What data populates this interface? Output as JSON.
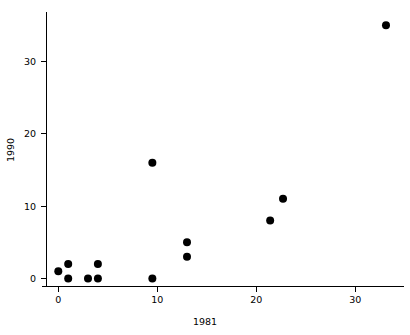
{
  "chart_data": {
    "type": "scatter",
    "title": "",
    "xlabel": "1981",
    "ylabel": "1990",
    "xlim": [
      -1.5,
      35.5
    ],
    "ylim": [
      -1.5,
      36.5
    ],
    "xticks": [
      0,
      10,
      20,
      30
    ],
    "xticklabels": [
      "0",
      "10",
      "20",
      "30"
    ],
    "yticks": [
      0,
      10,
      20,
      30
    ],
    "yticklabels": [
      "0",
      "10",
      "20",
      "30"
    ],
    "grid": false,
    "legend": null,
    "marker": {
      "shape": "circle",
      "color": "#000000",
      "size": 4.0
    },
    "series": [
      {
        "name": "points",
        "points": [
          {
            "x": 0,
            "y": 1
          },
          {
            "x": 1,
            "y": 2
          },
          {
            "x": 1,
            "y": 0
          },
          {
            "x": 3,
            "y": 0
          },
          {
            "x": 4,
            "y": 2
          },
          {
            "x": 4,
            "y": 0
          },
          {
            "x": 9.5,
            "y": 16
          },
          {
            "x": 9.5,
            "y": 0
          },
          {
            "x": 13,
            "y": 5
          },
          {
            "x": 13,
            "y": 3
          },
          {
            "x": 21.4,
            "y": 8
          },
          {
            "x": 22.7,
            "y": 11
          },
          {
            "x": 33.1,
            "y": 35
          }
        ]
      }
    ]
  },
  "axes": {
    "x_axis_label": "1981",
    "y_axis_label": "1990",
    "x_tick_labels": [
      "0",
      "10",
      "20",
      "30"
    ],
    "y_tick_labels": [
      "0",
      "10",
      "20",
      "30"
    ]
  }
}
